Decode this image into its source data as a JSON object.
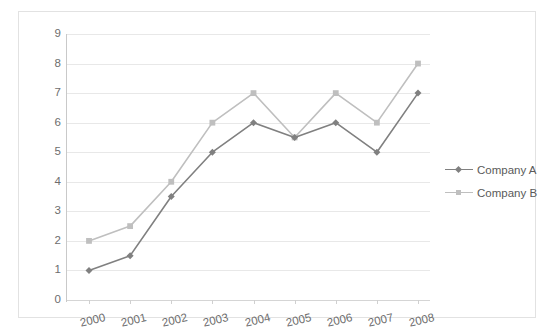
{
  "chart_data": {
    "type": "line",
    "title": "",
    "xlabel": "",
    "ylabel": "",
    "categories": [
      "2000",
      "2001",
      "2002",
      "2003",
      "2004",
      "2005",
      "2006",
      "2007",
      "2008"
    ],
    "series": [
      {
        "name": "Company A",
        "color": "#808080",
        "marker": "diamond",
        "values": [
          1,
          1.5,
          3.5,
          5,
          6,
          5.5,
          6,
          5,
          7
        ]
      },
      {
        "name": "Company B",
        "color": "#bfbfbf",
        "marker": "square",
        "values": [
          2,
          2.5,
          4,
          6,
          7,
          5.5,
          7,
          6,
          8
        ]
      }
    ],
    "ylim": [
      0,
      9
    ],
    "ytick_labels": [
      "0",
      "1",
      "2",
      "3",
      "4",
      "5",
      "6",
      "7",
      "8",
      "9"
    ],
    "ytick_values": [
      0,
      1,
      2,
      3,
      4,
      5,
      6,
      7,
      8,
      9
    ],
    "grid": true,
    "grid_axis": "y",
    "legend_position": "right",
    "x_label_rotation": -13,
    "axis_label_color": "#6d6d6d",
    "gridline_color": "#e8e8e8",
    "frame_color": "#e2e2e2",
    "background_color": "#ffffff"
  }
}
